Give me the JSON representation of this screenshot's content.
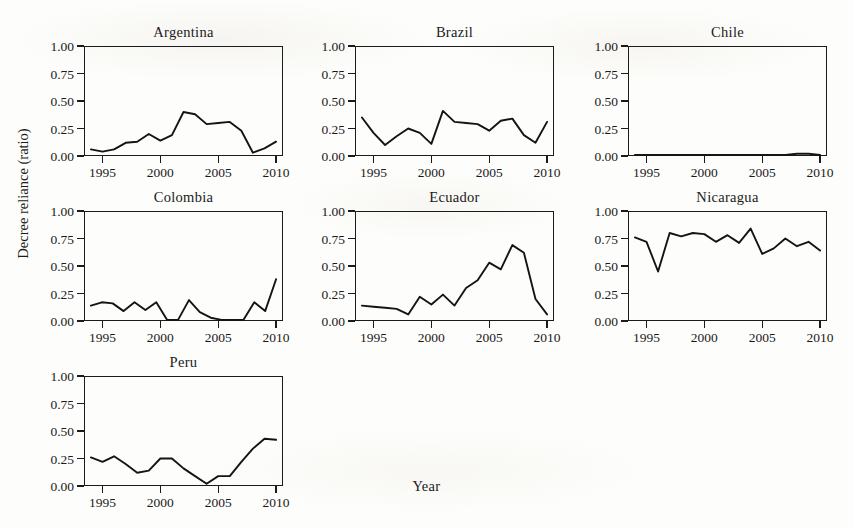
{
  "figure": {
    "ylabel": "Decree reliance (ratio)",
    "xlabel": "Year",
    "ink_color": "#141414",
    "background_color": "#fdfdfb"
  },
  "chart_data": {
    "type": "line",
    "title": "",
    "xlabel": "Year",
    "ylabel": "Decree reliance (ratio)",
    "xlim": [
      1993.4,
      2010.6
    ],
    "ylim": [
      0.0,
      1.0
    ],
    "xticks": [
      1995,
      2000,
      2005,
      2010
    ],
    "xtick_labels": [
      "1995",
      "2000",
      "2005",
      "2010"
    ],
    "yticks": [
      0.0,
      0.25,
      0.5,
      0.75,
      1.0
    ],
    "ytick_labels": [
      "0.00",
      "0.25",
      "0.50",
      "0.75",
      "1.00"
    ],
    "grid": false,
    "legend": "none",
    "layout": "small-multiples 3x3 (7 panels used)",
    "x": [
      1994,
      1995,
      1996,
      1997,
      1998,
      1999,
      2000,
      2001,
      2002,
      2003,
      2004,
      2005,
      2006,
      2007,
      2008,
      2009,
      2010
    ],
    "panels": [
      {
        "name": "Argentina",
        "row": 0,
        "col": 0,
        "values": [
          0.06,
          0.04,
          0.06,
          0.12,
          0.13,
          0.2,
          0.14,
          0.19,
          0.4,
          0.38,
          0.29,
          0.3,
          0.31,
          0.23,
          0.03,
          0.07,
          0.13
        ]
      },
      {
        "name": "Brazil",
        "row": 0,
        "col": 1,
        "values": [
          0.35,
          0.21,
          0.1,
          0.18,
          0.25,
          0.21,
          0.11,
          0.41,
          0.31,
          0.3,
          0.29,
          0.23,
          0.32,
          0.34,
          0.19,
          0.12,
          0.31
        ]
      },
      {
        "name": "Chile",
        "row": 0,
        "col": 2,
        "values": [
          0.01,
          0.01,
          0.01,
          0.01,
          0.01,
          0.01,
          0.01,
          0.01,
          0.01,
          0.01,
          0.01,
          0.01,
          0.01,
          0.01,
          0.02,
          0.02,
          0.01
        ]
      },
      {
        "name": "Colombia",
        "row": 1,
        "col": 0,
        "values": [
          0.14,
          0.17,
          0.16,
          0.09,
          0.17,
          0.1,
          0.17,
          0.01,
          0.01,
          0.19,
          0.08,
          0.03,
          0.01,
          0.01,
          0.01,
          0.17,
          0.09,
          0.38
        ]
      },
      {
        "name": "Ecuador",
        "row": 1,
        "col": 1,
        "values": [
          0.14,
          0.13,
          0.12,
          0.11,
          0.06,
          0.22,
          0.15,
          0.24,
          0.14,
          0.3,
          0.37,
          0.53,
          0.47,
          0.69,
          0.62,
          0.2,
          0.06
        ]
      },
      {
        "name": "Nicaragua",
        "row": 1,
        "col": 2,
        "values": [
          0.76,
          0.72,
          0.45,
          0.8,
          0.77,
          0.8,
          0.79,
          0.72,
          0.78,
          0.71,
          0.84,
          0.61,
          0.66,
          0.75,
          0.68,
          0.72,
          0.64
        ]
      },
      {
        "name": "Peru",
        "row": 2,
        "col": 0,
        "values": [
          0.26,
          0.22,
          0.27,
          0.2,
          0.12,
          0.14,
          0.25,
          0.25,
          0.16,
          0.09,
          0.02,
          0.09,
          0.09,
          0.22,
          0.34,
          0.43,
          0.42
        ]
      }
    ]
  }
}
